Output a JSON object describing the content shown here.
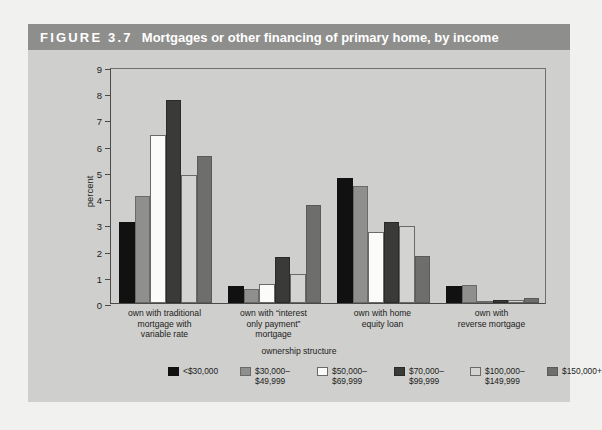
{
  "figure": {
    "number": "FIGURE 3.7",
    "title": "Mortgages or other financing of primary home, by income"
  },
  "chart_data": {
    "type": "bar",
    "title": "Mortgages or other financing of primary home, by income",
    "xlabel": "ownership structure",
    "ylabel": "percent",
    "ylim": [
      0,
      9
    ],
    "yticks": [
      "0",
      "1",
      "2",
      "3",
      "4",
      "5",
      "6",
      "7",
      "8",
      "9"
    ],
    "grid": false,
    "legend_position": "bottom",
    "categories": [
      "own with traditional\nmortgage with\nvariable rate",
      "own with “interest\nonly payment”\nmortgage",
      "own with home\nequity loan",
      "own with\nreverse mortgage"
    ],
    "series": [
      {
        "name": "<$30,000",
        "color": "#111111",
        "border": "#111111",
        "values": [
          3.1,
          0.65,
          4.75,
          0.65
        ]
      },
      {
        "name": "$30,000–\n$49,999",
        "color": "#8f8f8d",
        "border": "#6a6a68",
        "values": [
          4.1,
          0.55,
          4.45,
          0.7
        ]
      },
      {
        "name": "$50,000–\n$69,999",
        "color": "#fbfbf9",
        "border": "#6a6a68",
        "values": [
          6.4,
          0.72,
          2.7,
          0.05
        ]
      },
      {
        "name": "$70,000–\n$99,999",
        "color": "#3a3a38",
        "border": "#2a2a28",
        "values": [
          7.75,
          1.75,
          3.1,
          0.1
        ]
      },
      {
        "name": "$100,000–\n$149,999",
        "color": "#d3d3d1",
        "border": "#6a6a68",
        "values": [
          4.9,
          1.1,
          2.95,
          0.1
        ]
      },
      {
        "name": "$150,000+",
        "color": "#6e6e6c",
        "border": "#5a5a58",
        "values": [
          5.6,
          3.75,
          1.8,
          0.2
        ]
      }
    ]
  },
  "legend": {
    "items": [
      {
        "label": "<$30,000",
        "left": 58
      },
      {
        "label": "$30,000–\n$49,999",
        "left": 130
      },
      {
        "label": "$50,000–\n$69,999",
        "left": 207
      },
      {
        "label": "$70,000–\n$99,999",
        "left": 284
      },
      {
        "label": "$100,000–\n$149,999",
        "left": 360
      },
      {
        "label": "$150,000+",
        "left": 437
      }
    ]
  }
}
